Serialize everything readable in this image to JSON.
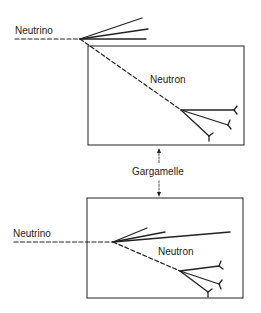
{
  "diagram": {
    "top_event": {
      "incoming_label": "Neutrino",
      "neutral_label": "Neutron"
    },
    "chamber_label": "Gargamelle",
    "bottom_event": {
      "incoming_label": "Neutrino",
      "neutral_label": "Neutron"
    },
    "colors": {
      "ink": "#222222",
      "background": "#ffffff"
    }
  }
}
